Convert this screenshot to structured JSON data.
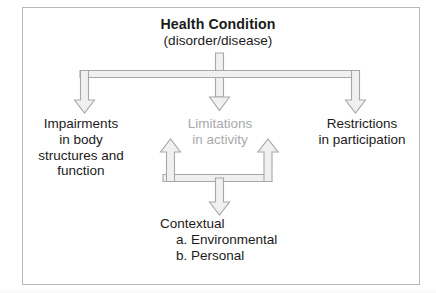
{
  "diagram": {
    "frame": {
      "border_color": "#b7b7b7",
      "background_color": "#ffffff"
    },
    "colors": {
      "text": "#1b1b1b",
      "muted_text": "#a9a9a9",
      "arrow_fill": "#f0f0f0",
      "arrow_stroke": "#a8a8a8"
    },
    "nodes": {
      "health_condition": {
        "line1": "Health Condition",
        "line2": "(disorder/disease)"
      },
      "impairments": {
        "line1": "Impairments",
        "line2": "in body",
        "line3": "structures and",
        "line4": "function"
      },
      "limitations": {
        "line1": "Limitations",
        "line2": "in activity"
      },
      "restrictions": {
        "line1": "Restrictions",
        "line2": "in participation"
      },
      "contextual": {
        "line1": "Contextual",
        "line2": "a. Environmental",
        "line3": "b. Personal"
      }
    },
    "arrows": [
      {
        "name": "health-to-impairments",
        "direction": "down"
      },
      {
        "name": "health-to-limitations",
        "direction": "down"
      },
      {
        "name": "health-to-restrictions",
        "direction": "down"
      },
      {
        "name": "contextual-to-limitations-left",
        "direction": "up"
      },
      {
        "name": "contextual-to-limitations-right",
        "direction": "up"
      },
      {
        "name": "limitations-to-contextual",
        "direction": "down"
      }
    ]
  }
}
